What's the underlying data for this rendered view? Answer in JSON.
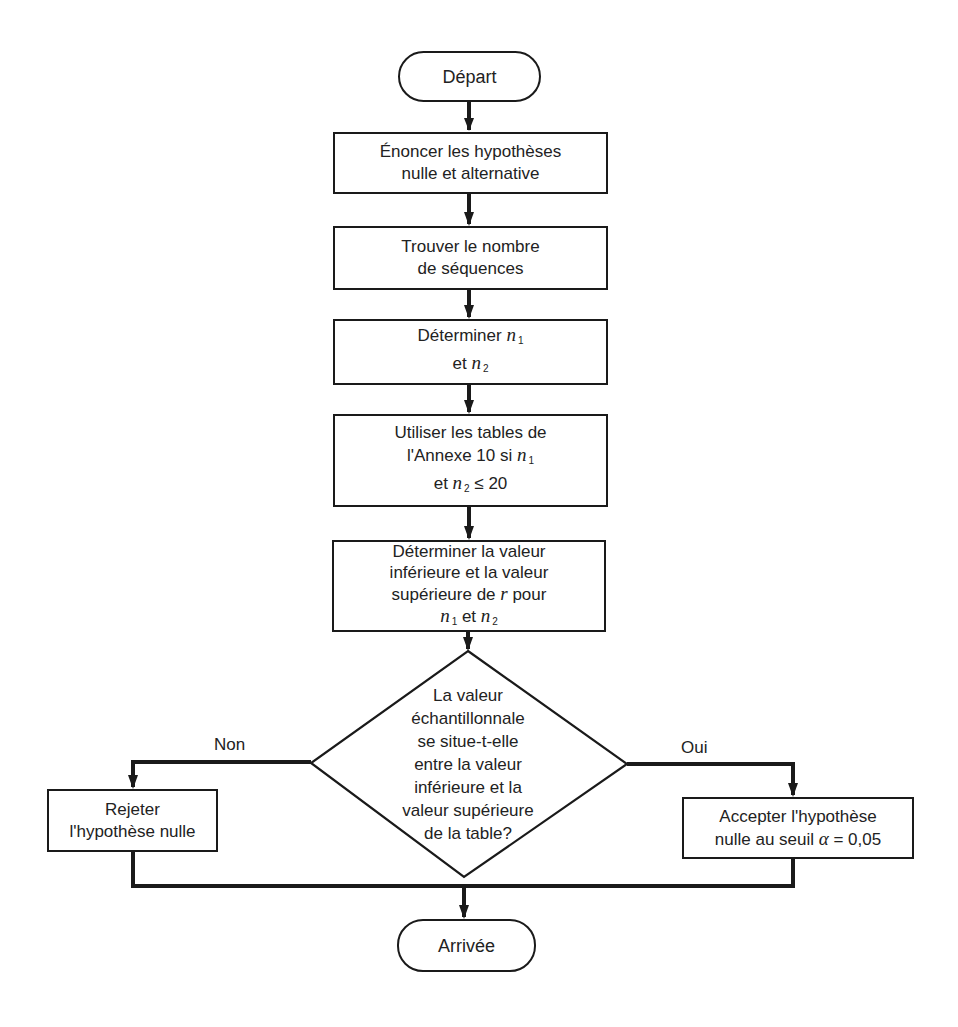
{
  "diagram": {
    "type": "flowchart",
    "language": "fr",
    "nodes": {
      "start": {
        "shape": "terminal",
        "label": "Départ"
      },
      "step1": {
        "shape": "process",
        "lines": [
          "Énoncer les hypothèses",
          "nulle et alternative"
        ]
      },
      "step2": {
        "shape": "process",
        "lines": [
          "Trouver le nombre",
          "de séquences"
        ]
      },
      "step3": {
        "shape": "process",
        "line1_text": "Déterminer ",
        "line2_text": "et ",
        "var": "n",
        "sub1": "1",
        "sub2": "2"
      },
      "step4": {
        "shape": "process",
        "line1": "Utiliser les tables de",
        "line2_text": "l'Annexe 10 si ",
        "line3_text": "et ",
        "line3_tail": " ≤ 20",
        "var": "n",
        "sub1": "1",
        "sub2": "2"
      },
      "step5": {
        "shape": "process",
        "line1": "Déterminer la valeur",
        "line2": "inférieure et la valeur",
        "line3_text": "supérieure de ",
        "line3_var": "r",
        "line3_tail": " pour",
        "line4_mid": " et ",
        "var": "n",
        "sub1": "1",
        "sub2": "2"
      },
      "decision": {
        "shape": "decision",
        "lines": [
          "La valeur",
          "échantillonnale",
          "se situe-t-elle",
          "entre la valeur",
          "inférieure et la",
          "valeur supérieure",
          "de la table?"
        ]
      },
      "reject": {
        "shape": "process",
        "lines": [
          "Rejeter",
          "l'hypothèse nulle"
        ]
      },
      "accept": {
        "shape": "process",
        "line1": "Accepter l'hypothèse",
        "line2_text": "nulle au seuil ",
        "line2_var": "α",
        "line2_tail": " = 0,05"
      },
      "end": {
        "shape": "terminal",
        "label": "Arrivée"
      }
    },
    "edges": [
      {
        "from": "start",
        "to": "step1"
      },
      {
        "from": "step1",
        "to": "step2"
      },
      {
        "from": "step2",
        "to": "step3"
      },
      {
        "from": "step3",
        "to": "step4"
      },
      {
        "from": "step4",
        "to": "step5"
      },
      {
        "from": "step5",
        "to": "decision"
      },
      {
        "from": "decision",
        "to": "reject",
        "label": "Non"
      },
      {
        "from": "decision",
        "to": "accept",
        "label": "Oui"
      },
      {
        "from": "reject",
        "to": "end"
      },
      {
        "from": "accept",
        "to": "end"
      }
    ],
    "edge_labels": {
      "no": "Non",
      "yes": "Oui"
    },
    "colors": {
      "stroke": "#1a1a1a",
      "background": "#ffffff",
      "text": "#222222"
    }
  }
}
